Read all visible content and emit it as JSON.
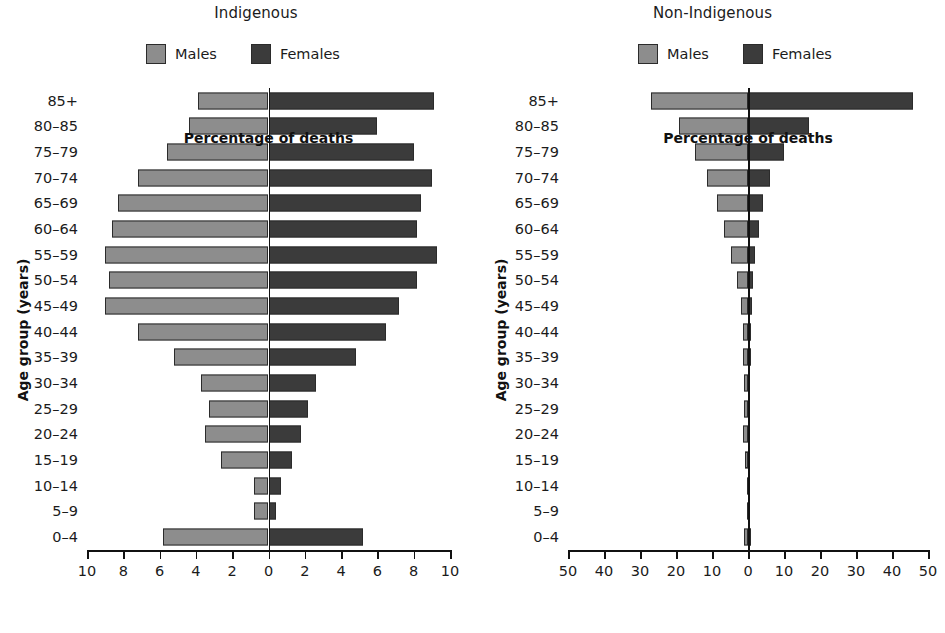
{
  "figure": {
    "legend": {
      "males_label": "Males",
      "females_label": "Females"
    },
    "colors": {
      "males": "#8d8d8d",
      "females": "#3b3b3b",
      "axis": "#111111"
    }
  },
  "chart_data": [
    {
      "type": "bar",
      "title": "Indigenous",
      "subtype": "population-pyramid",
      "xlabel": "Percentage of deaths",
      "ylabel": "Age group (years)",
      "xlim": [
        -10,
        10
      ],
      "xticks": [
        -10,
        -8,
        -6,
        -4,
        -2,
        0,
        2,
        4,
        6,
        8,
        10
      ],
      "xticklabels": [
        "10",
        "8",
        "6",
        "4",
        "2",
        "0",
        "2",
        "4",
        "6",
        "8",
        "10"
      ],
      "grid": false,
      "legend_position": "top-center",
      "categories": [
        "85+",
        "80–85",
        "75–79",
        "70–74",
        "65–69",
        "60–64",
        "55–59",
        "50–54",
        "45–49",
        "40–44",
        "35–39",
        "30–34",
        "25–29",
        "20–24",
        "15–19",
        "10–14",
        "5–9",
        "0–4"
      ],
      "series": [
        {
          "name": "Males",
          "values": [
            3.9,
            4.4,
            5.6,
            7.2,
            8.3,
            8.6,
            9.0,
            8.8,
            9.0,
            7.2,
            5.2,
            3.7,
            3.3,
            3.5,
            2.6,
            0.8,
            0.8,
            5.8
          ]
        },
        {
          "name": "Females",
          "values": [
            9.1,
            6.0,
            8.0,
            9.0,
            8.4,
            8.2,
            9.3,
            8.2,
            7.2,
            6.5,
            4.8,
            2.6,
            2.2,
            1.8,
            1.3,
            0.7,
            0.4,
            5.2
          ]
        }
      ]
    },
    {
      "type": "bar",
      "title": "Non-Indigenous",
      "subtype": "population-pyramid",
      "xlabel": "Percentage of deaths",
      "ylabel": "Age group (years)",
      "xlim": [
        -50,
        50
      ],
      "xticks": [
        -50,
        -40,
        -30,
        -20,
        -10,
        0,
        10,
        20,
        30,
        40,
        50
      ],
      "xticklabels": [
        "50",
        "40",
        "30",
        "20",
        "10",
        "0",
        "10",
        "20",
        "30",
        "40",
        "50"
      ],
      "grid": false,
      "legend_position": "top-center",
      "categories": [
        "85+",
        "80–85",
        "75–79",
        "70–74",
        "65–69",
        "60–64",
        "55–59",
        "50–54",
        "45–49",
        "40–44",
        "35–39",
        "30–34",
        "25–29",
        "20–24",
        "15–19",
        "10–14",
        "5–9",
        "0–4"
      ],
      "series": [
        {
          "name": "Males",
          "values": [
            27.0,
            19.2,
            14.6,
            11.4,
            8.7,
            6.6,
            4.6,
            3.1,
            2.0,
            1.5,
            1.3,
            1.1,
            1.2,
            1.4,
            0.7,
            0.2,
            0.2,
            1.0
          ]
        },
        {
          "name": "Females",
          "values": [
            45.8,
            16.9,
            10.1,
            6.2,
            4.1,
            3.0,
            2.0,
            1.4,
            1.0,
            0.9,
            0.8,
            0.6,
            0.5,
            0.5,
            0.3,
            0.2,
            0.2,
            0.9
          ]
        }
      ]
    }
  ]
}
